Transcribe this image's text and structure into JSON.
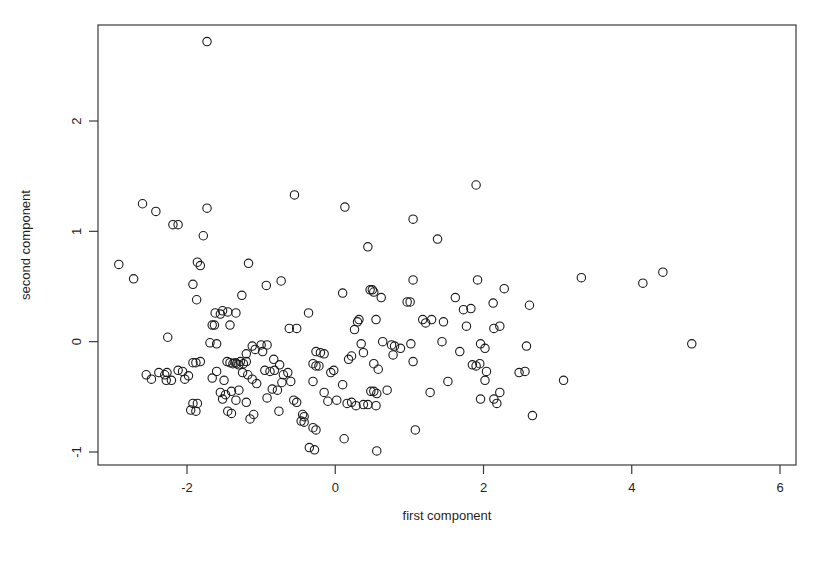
{
  "chart_data": {
    "type": "scatter",
    "title": "",
    "subtitle": "",
    "xlabel": "first component",
    "ylabel": "second component",
    "xlim": [
      -3.15,
      6.2
    ],
    "ylim": [
      -1.15,
      2.9
    ],
    "xticks": [
      -2,
      0,
      2,
      4,
      6
    ],
    "xticklabels": [
      "-2",
      "0",
      "2",
      "4",
      "6"
    ],
    "yticks": [
      -1,
      0,
      1,
      2
    ],
    "yticklabels": [
      "-1",
      "0",
      "1",
      "2"
    ],
    "grid": false,
    "legend": null,
    "legend_position": "none",
    "marker": {
      "shape": "circle-open",
      "radius_px": 4.2,
      "stroke": "#1a1a1a",
      "stroke_width_px": 1.1,
      "fill": "none"
    },
    "box_frame": true,
    "series": [
      {
        "name": "observations",
        "n_points": 196,
        "points": [
          [
            -1.73,
            2.72
          ],
          [
            -2.6,
            1.25
          ],
          [
            -2.42,
            1.18
          ],
          [
            -2.19,
            1.06
          ],
          [
            -2.12,
            1.06
          ],
          [
            -1.73,
            1.21
          ],
          [
            -0.55,
            1.33
          ],
          [
            0.13,
            1.22
          ],
          [
            1.9,
            1.42
          ],
          [
            1.05,
            1.11
          ],
          [
            -1.78,
            0.96
          ],
          [
            1.38,
            0.93
          ],
          [
            0.44,
            0.86
          ],
          [
            -2.92,
            0.7
          ],
          [
            -1.86,
            0.72
          ],
          [
            -1.82,
            0.69
          ],
          [
            -1.17,
            0.71
          ],
          [
            -2.72,
            0.57
          ],
          [
            -1.92,
            0.52
          ],
          [
            -0.93,
            0.51
          ],
          [
            -0.73,
            0.55
          ],
          [
            1.05,
            0.56
          ],
          [
            1.92,
            0.56
          ],
          [
            3.32,
            0.58
          ],
          [
            4.15,
            0.53
          ],
          [
            4.42,
            0.63
          ],
          [
            0.1,
            0.44
          ],
          [
            0.47,
            0.47
          ],
          [
            0.5,
            0.47
          ],
          [
            0.52,
            0.45
          ],
          [
            2.28,
            0.48
          ],
          [
            -1.87,
            0.38
          ],
          [
            -1.26,
            0.42
          ],
          [
            0.62,
            0.4
          ],
          [
            0.97,
            0.36
          ],
          [
            1.01,
            0.36
          ],
          [
            2.13,
            0.35
          ],
          [
            2.62,
            0.33
          ],
          [
            1.73,
            0.29
          ],
          [
            1.83,
            0.3
          ],
          [
            -1.62,
            0.26
          ],
          [
            -1.55,
            0.25
          ],
          [
            -1.45,
            0.27
          ],
          [
            -1.66,
            0.15
          ],
          [
            -1.63,
            0.15
          ],
          [
            -1.42,
            0.15
          ],
          [
            -0.62,
            0.12
          ],
          [
            -0.52,
            0.12
          ],
          [
            0.3,
            0.18
          ],
          [
            0.55,
            0.2
          ],
          [
            1.18,
            0.2
          ],
          [
            1.22,
            0.17
          ],
          [
            1.46,
            0.18
          ],
          [
            1.77,
            0.14
          ],
          [
            2.14,
            0.12
          ],
          [
            2.22,
            0.14
          ],
          [
            -2.26,
            0.04
          ],
          [
            -1.69,
            -0.01
          ],
          [
            -1.6,
            -0.02
          ],
          [
            -1.12,
            -0.04
          ],
          [
            -1.0,
            -0.03
          ],
          [
            -0.92,
            -0.03
          ],
          [
            0.35,
            -0.02
          ],
          [
            0.64,
            0.0
          ],
          [
            0.76,
            -0.03
          ],
          [
            0.8,
            -0.04
          ],
          [
            1.02,
            -0.02
          ],
          [
            1.44,
            0.0
          ],
          [
            1.96,
            -0.02
          ],
          [
            2.02,
            -0.06
          ],
          [
            2.58,
            -0.04
          ],
          [
            4.81,
            -0.02
          ],
          [
            -0.26,
            -0.09
          ],
          [
            -0.2,
            -0.1
          ],
          [
            -0.15,
            -0.11
          ],
          [
            0.38,
            -0.1
          ],
          [
            0.78,
            -0.12
          ],
          [
            1.68,
            -0.09
          ],
          [
            -1.92,
            -0.19
          ],
          [
            -1.88,
            -0.19
          ],
          [
            -1.82,
            -0.18
          ],
          [
            -1.46,
            -0.18
          ],
          [
            -1.42,
            -0.19
          ],
          [
            -1.38,
            -0.2
          ],
          [
            -1.35,
            -0.19
          ],
          [
            -1.33,
            -0.2
          ],
          [
            -1.3,
            -0.21
          ],
          [
            -1.28,
            -0.18
          ],
          [
            -1.24,
            -0.2
          ],
          [
            -1.2,
            -0.18
          ],
          [
            -0.83,
            -0.16
          ],
          [
            -0.75,
            -0.21
          ],
          [
            -0.3,
            -0.2
          ],
          [
            -0.26,
            -0.22
          ],
          [
            -0.22,
            -0.22
          ],
          [
            0.52,
            -0.2
          ],
          [
            1.05,
            -0.18
          ],
          [
            1.85,
            -0.21
          ],
          [
            1.9,
            -0.22
          ],
          [
            1.95,
            -0.2
          ],
          [
            -2.38,
            -0.28
          ],
          [
            -2.3,
            -0.3
          ],
          [
            -2.27,
            -0.28
          ],
          [
            -2.12,
            -0.26
          ],
          [
            -2.06,
            -0.27
          ],
          [
            -1.98,
            -0.31
          ],
          [
            -1.6,
            -0.27
          ],
          [
            -0.95,
            -0.26
          ],
          [
            -0.88,
            -0.27
          ],
          [
            -0.82,
            -0.26
          ],
          [
            0.58,
            -0.25
          ],
          [
            2.04,
            -0.27
          ],
          [
            2.48,
            -0.28
          ],
          [
            2.56,
            -0.27
          ],
          [
            -2.28,
            -0.35
          ],
          [
            -2.21,
            -0.35
          ],
          [
            -2.03,
            -0.34
          ],
          [
            -1.66,
            -0.33
          ],
          [
            -1.5,
            -0.35
          ],
          [
            -1.12,
            -0.34
          ],
          [
            -1.06,
            -0.38
          ],
          [
            -0.72,
            -0.37
          ],
          [
            -0.6,
            -0.36
          ],
          [
            -0.3,
            -0.36
          ],
          [
            0.1,
            -0.39
          ],
          [
            1.52,
            -0.36
          ],
          [
            2.02,
            -0.35
          ],
          [
            3.08,
            -0.35
          ],
          [
            -1.4,
            -0.45
          ],
          [
            -1.3,
            -0.44
          ],
          [
            -0.85,
            -0.43
          ],
          [
            -0.78,
            -0.44
          ],
          [
            -0.15,
            -0.46
          ],
          [
            0.48,
            -0.45
          ],
          [
            0.52,
            -0.45
          ],
          [
            0.56,
            -0.47
          ],
          [
            1.28,
            -0.46
          ],
          [
            -1.92,
            -0.56
          ],
          [
            -1.86,
            -0.56
          ],
          [
            -1.52,
            -0.52
          ],
          [
            -1.34,
            -0.53
          ],
          [
            -1.2,
            -0.55
          ],
          [
            -0.92,
            -0.51
          ],
          [
            -0.56,
            -0.53
          ],
          [
            -0.52,
            -0.55
          ],
          [
            -0.1,
            -0.54
          ],
          [
            0.02,
            -0.53
          ],
          [
            0.28,
            -0.58
          ],
          [
            0.38,
            -0.57
          ],
          [
            0.44,
            -0.57
          ],
          [
            0.55,
            -0.58
          ],
          [
            2.14,
            -0.52
          ],
          [
            2.18,
            -0.56
          ],
          [
            -1.95,
            -0.62
          ],
          [
            -1.88,
            -0.63
          ],
          [
            -1.45,
            -0.63
          ],
          [
            -1.4,
            -0.65
          ],
          [
            -1.1,
            -0.66
          ],
          [
            -0.76,
            -0.63
          ],
          [
            -0.44,
            -0.66
          ],
          [
            -0.42,
            -0.68
          ],
          [
            2.66,
            -0.67
          ],
          [
            -1.15,
            -0.7
          ],
          [
            -0.46,
            -0.72
          ],
          [
            -0.42,
            -0.73
          ],
          [
            -0.3,
            -0.78
          ],
          [
            -0.26,
            -0.8
          ],
          [
            1.08,
            -0.8
          ],
          [
            0.12,
            -0.88
          ],
          [
            -0.35,
            -0.96
          ],
          [
            -0.28,
            -0.98
          ],
          [
            0.56,
            -0.99
          ],
          [
            -2.55,
            -0.3
          ],
          [
            -2.48,
            -0.34
          ],
          [
            -1.2,
            -0.11
          ],
          [
            -1.08,
            -0.07
          ],
          [
            -0.98,
            -0.09
          ],
          [
            -1.25,
            -0.28
          ],
          [
            -1.18,
            -0.3
          ],
          [
            -0.7,
            -0.3
          ],
          [
            -0.64,
            -0.28
          ],
          [
            0.22,
            -0.13
          ],
          [
            0.18,
            -0.16
          ],
          [
            0.7,
            -0.44
          ],
          [
            0.88,
            -0.06
          ],
          [
            1.3,
            0.2
          ],
          [
            1.62,
            0.4
          ],
          [
            0.32,
            0.2
          ],
          [
            0.26,
            0.11
          ],
          [
            -0.02,
            -0.26
          ],
          [
            -0.06,
            -0.28
          ],
          [
            0.16,
            -0.56
          ],
          [
            0.22,
            -0.55
          ],
          [
            1.96,
            -0.52
          ],
          [
            -1.52,
            0.28
          ],
          [
            -1.34,
            0.26
          ],
          [
            -0.36,
            0.26
          ],
          [
            -1.55,
            -0.46
          ],
          [
            -1.48,
            -0.48
          ],
          [
            2.22,
            -0.46
          ]
        ]
      }
    ]
  },
  "axes": {
    "x_axis_name": "first component",
    "y_axis_name": "second component"
  }
}
